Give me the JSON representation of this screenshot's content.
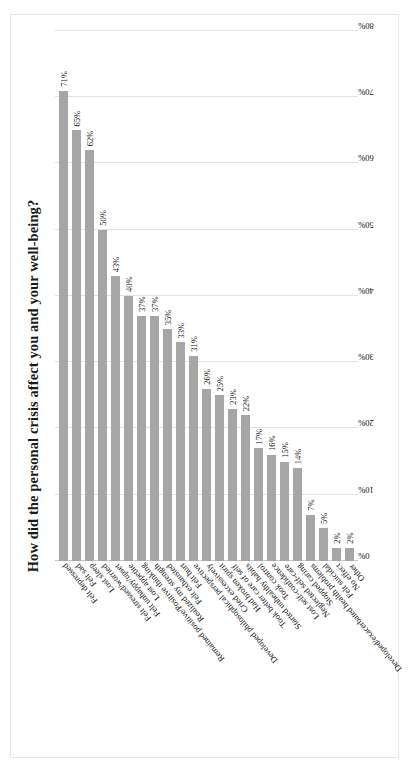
{
  "chart_data": {
    "type": "bar",
    "orientation": "horizontal",
    "title": "How did the personal crisis affect you and your well-being?",
    "xlabel": "",
    "ylabel": "",
    "xlim": [
      0,
      80
    ],
    "ticks": [
      "0%",
      "10%",
      "20%",
      "30%",
      "40%",
      "50%",
      "60%",
      "70%",
      "80%"
    ],
    "tick_values": [
      0,
      10,
      20,
      30,
      40,
      50,
      60,
      70,
      80
    ],
    "grid": true,
    "legend": "none",
    "value_suffix": "%",
    "bar_color": "#a6a6a6",
    "gridline_color": "#e2e2e2",
    "categories": [
      "Felt depressed",
      "Felt sad",
      "Lost sleep",
      "Felt stressed/worried",
      "Felt unhappy/upset",
      "Lost appetite",
      "Remained positive/Positive thinking",
      "Realized my strength",
      "Felt exhausted",
      "Felt hurt",
      "Developed philosophical perspective",
      "Cried excessively",
      "Had broken spirit",
      "Took better care of self",
      "Started unhealthy habits",
      "Took control",
      "Lost self-confidence",
      "Neglected self-care",
      "Stopped caring",
      "Developed/exacerbated health problems",
      "Felt suicidal",
      "No effect",
      "Other"
    ],
    "values": [
      71,
      65,
      62,
      50,
      43,
      40,
      37,
      37,
      35,
      33,
      31,
      26,
      25,
      23,
      22,
      17,
      16,
      15,
      14,
      7,
      5,
      2,
      2
    ],
    "value_labels": [
      "71%",
      "65%",
      "62%",
      "50%",
      "43%",
      "40%",
      "37%",
      "37%",
      "35%",
      "33%",
      "31%",
      "26%",
      "25%",
      "23%",
      "22%",
      "17%",
      "16%",
      "15%",
      "14%",
      "7%",
      "5%",
      "2%",
      "2%"
    ]
  }
}
